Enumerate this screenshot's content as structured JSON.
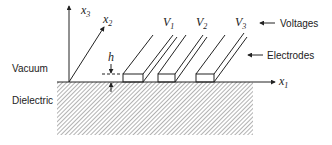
{
  "diagram": {
    "region_labels": {
      "vacuum": "Vacuum",
      "dielectric": "Dielectric"
    },
    "axes": {
      "x1": {
        "var": "x",
        "sub": "1"
      },
      "x2": {
        "var": "x",
        "sub": "2"
      },
      "x3": {
        "var": "x",
        "sub": "3"
      }
    },
    "height_label": "h",
    "electrodes": [
      {
        "var": "V",
        "sub": "1"
      },
      {
        "var": "V",
        "sub": "2"
      },
      {
        "var": "V",
        "sub": "3"
      }
    ],
    "callouts": {
      "voltages": "Voltages",
      "electrodes": "Electrodes"
    },
    "colors": {
      "line": "#222222",
      "hatch": "#555555",
      "background": "#ffffff"
    }
  }
}
